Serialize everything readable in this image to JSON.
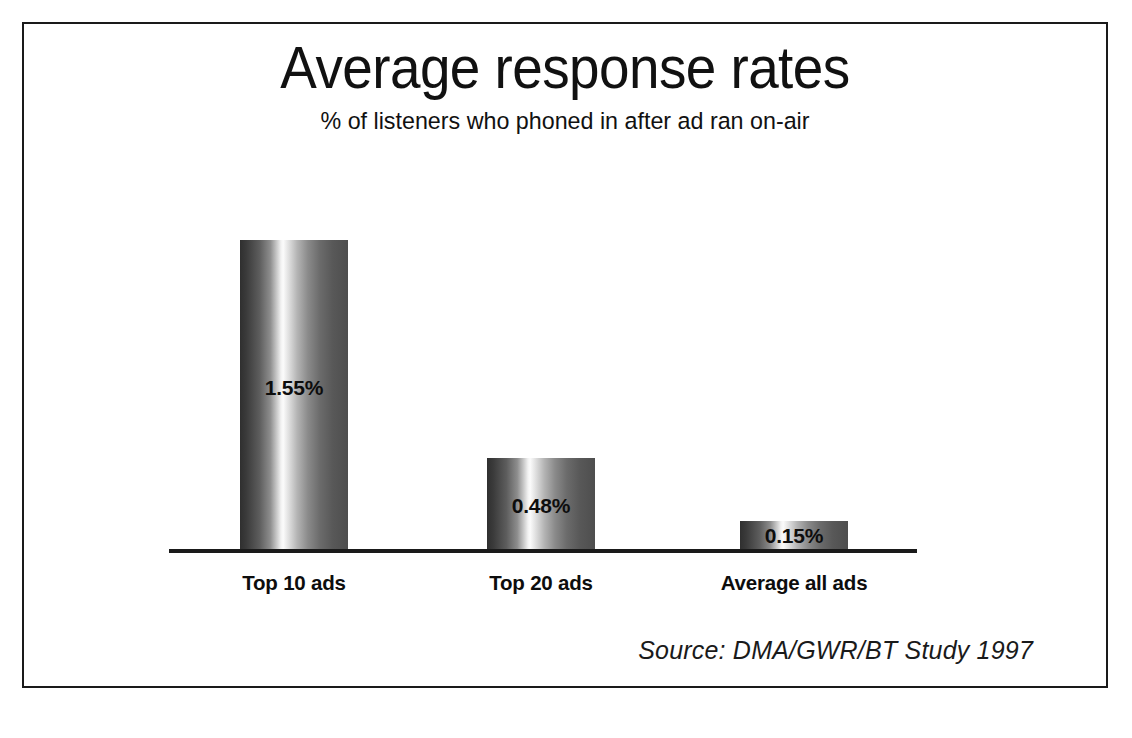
{
  "chart_data": {
    "type": "bar",
    "title": "Average response rates",
    "subtitle": "% of listeners who phoned in after ad ran on-air",
    "categories": [
      "Top 10 ads",
      "Top 20 ads",
      "Average all ads"
    ],
    "values": [
      1.55,
      0.48,
      0.15
    ],
    "value_labels": [
      "1.55%",
      "0.48%",
      "0.15%"
    ],
    "xlabel": "",
    "ylabel": "",
    "ylim": [
      0,
      1.75
    ],
    "grid": false,
    "legend": false,
    "axis_visible": "baseline-only",
    "source": "Source: DMA/GWR/BT Study 1997",
    "bar_style": {
      "fill": "horizontal-gradient-cylinder",
      "edge_dark": "#2f2f2f",
      "highlight": "#fbfbfb",
      "right_tone": "#4e4e4e"
    },
    "colors": {
      "text": "#111111",
      "axis": "#1a1a1a",
      "border": "#1a1a1a",
      "background": "#ffffff"
    }
  }
}
